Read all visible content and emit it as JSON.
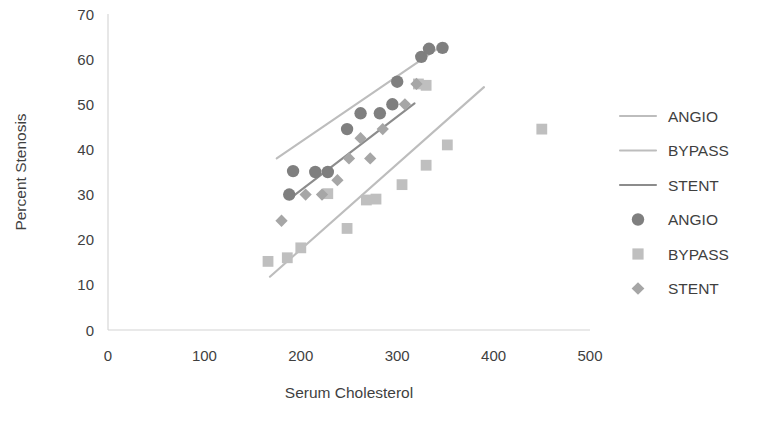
{
  "chart_data": {
    "type": "scatter",
    "title": "",
    "xlabel": "Serum Cholesterol",
    "ylabel": "Percent Stenosis",
    "xlim": [
      0,
      500
    ],
    "ylim": [
      0,
      70
    ],
    "xticks": [
      "0",
      "100",
      "200",
      "300",
      "400",
      "500"
    ],
    "yticks": [
      "0",
      "10",
      "20",
      "30",
      "40",
      "50",
      "60",
      "70"
    ],
    "xtick_values": [
      0,
      100,
      200,
      300,
      400,
      500
    ],
    "ytick_values": [
      0,
      10,
      20,
      30,
      40,
      50,
      60,
      70
    ],
    "grid": false,
    "legend_position": "right",
    "series": [
      {
        "name": "ANGIO",
        "marker": "circle",
        "color": "#7f7f7f",
        "points": [
          [
            188,
            30.0
          ],
          [
            192,
            35.2
          ],
          [
            215,
            35.0
          ],
          [
            228,
            35.0
          ],
          [
            248,
            44.5
          ],
          [
            262,
            48.0
          ],
          [
            282,
            48.0
          ],
          [
            295,
            50.0
          ],
          [
            300,
            55.0
          ],
          [
            325,
            60.5
          ],
          [
            347,
            62.5
          ],
          [
            333,
            62.3
          ]
        ]
      },
      {
        "name": "BYPASS",
        "marker": "square",
        "color": "#bfbfbf",
        "points": [
          [
            166,
            15.2
          ],
          [
            186,
            16.0
          ],
          [
            200,
            18.2
          ],
          [
            228,
            30.2
          ],
          [
            248,
            22.5
          ],
          [
            268,
            28.8
          ],
          [
            278,
            29.0
          ],
          [
            305,
            32.2
          ],
          [
            330,
            36.5
          ],
          [
            322,
            54.5
          ],
          [
            330,
            54.2
          ],
          [
            352,
            41.0
          ],
          [
            450,
            44.5
          ]
        ]
      },
      {
        "name": "STENT",
        "marker": "diamond",
        "color": "#a6a6a6",
        "points": [
          [
            180,
            24.2
          ],
          [
            205,
            30.0
          ],
          [
            222,
            30.0
          ],
          [
            238,
            33.2
          ],
          [
            250,
            38.0
          ],
          [
            262,
            42.5
          ],
          [
            272,
            38.0
          ],
          [
            285,
            44.5
          ],
          [
            308,
            50.0
          ],
          [
            320,
            54.5
          ]
        ]
      }
    ],
    "trendlines": [
      {
        "name": "ANGIO",
        "color": "#bdbdbd",
        "x0": 175,
        "y0": 38.0,
        "x1": 350,
        "y1": 63.5
      },
      {
        "name": "BYPASS",
        "color": "#bdbdbd",
        "x0": 168,
        "y0": 11.8,
        "x1": 390,
        "y1": 53.8
      },
      {
        "name": "STENT",
        "color": "#8c8c8c",
        "x0": 188,
        "y0": 29.0,
        "x1": 318,
        "y1": 50.2
      }
    ],
    "legend": [
      {
        "label": "ANGIO",
        "kind": "line",
        "color": "#bdbdbd"
      },
      {
        "label": "BYPASS",
        "kind": "line",
        "color": "#bdbdbd"
      },
      {
        "label": "STENT",
        "kind": "line",
        "color": "#8c8c8c"
      },
      {
        "label": "ANGIO",
        "kind": "circle",
        "color": "#7f7f7f"
      },
      {
        "label": "BYPASS",
        "kind": "square",
        "color": "#bfbfbf"
      },
      {
        "label": "STENT",
        "kind": "diamond",
        "color": "#a6a6a6"
      }
    ]
  }
}
